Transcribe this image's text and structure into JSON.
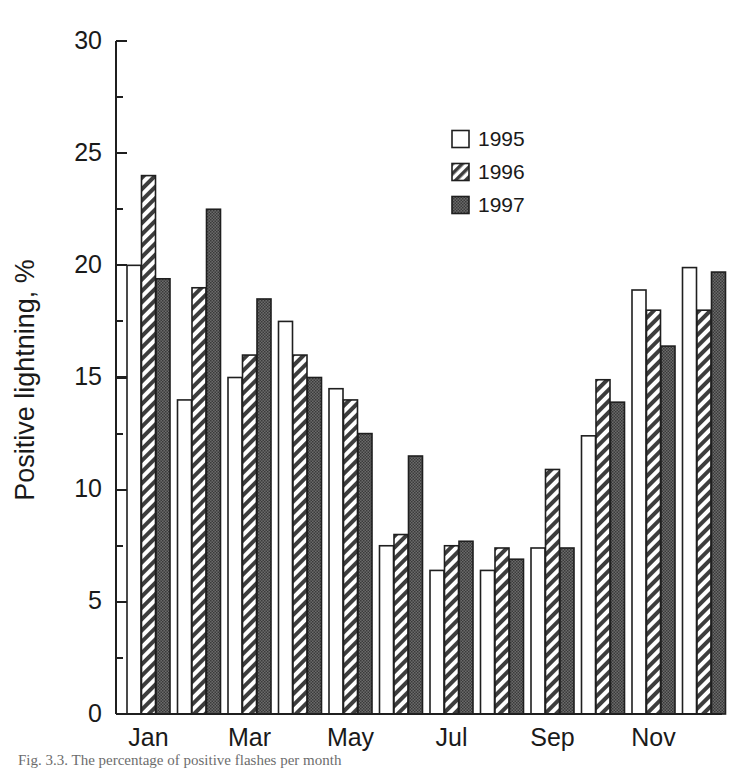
{
  "figure": {
    "caption": "Fig. 3.3.  The percentage of positive flashes per month"
  },
  "chart_data": {
    "type": "bar",
    "title": "",
    "xlabel": "",
    "ylabel": "Positive lightning, %",
    "ylim": [
      0,
      30
    ],
    "ytick_labels": [
      "0",
      "5",
      "10",
      "15",
      "20",
      "25",
      "30"
    ],
    "ytick_values": [
      0,
      5,
      10,
      15,
      20,
      25,
      30
    ],
    "yminor_values": [
      2.5,
      7.5,
      12.5,
      17.5,
      22.5,
      27.5
    ],
    "grid": false,
    "legend_position": "upper-center-right",
    "categories": [
      "Jan",
      "Feb",
      "Mar",
      "Apr",
      "May",
      "Jun",
      "Jul",
      "Aug",
      "Sep",
      "Oct",
      "Nov",
      "Dec"
    ],
    "xtick_labels": [
      "Jan",
      "Mar",
      "May",
      "Jul",
      "Sep",
      "Nov"
    ],
    "xtick_categories": [
      "Jan",
      "Mar",
      "May",
      "Jul",
      "Sep",
      "Nov"
    ],
    "series": [
      {
        "name": "1995",
        "fill": "open",
        "color": "#ffffff",
        "values": [
          20.0,
          14.0,
          15.0,
          17.5,
          14.5,
          7.5,
          6.4,
          6.4,
          7.4,
          12.4,
          18.9,
          19.9
        ]
      },
      {
        "name": "1996",
        "fill": "hatched",
        "color": "#d8d8d8",
        "values": [
          24.0,
          19.0,
          16.0,
          16.0,
          14.0,
          8.0,
          7.5,
          7.4,
          10.9,
          14.9,
          18.0,
          18.0
        ]
      },
      {
        "name": "1997",
        "fill": "solid",
        "color": "#5a5a5a",
        "values": [
          19.4,
          22.5,
          18.5,
          15.0,
          12.5,
          11.5,
          7.7,
          6.9,
          7.4,
          13.9,
          16.4,
          19.7
        ]
      }
    ]
  },
  "legend": {
    "entries": [
      {
        "label": "1995",
        "swatch": "open-square-swatch"
      },
      {
        "label": "1996",
        "swatch": "hatched-square-swatch"
      },
      {
        "label": "1997",
        "swatch": "solid-square-swatch"
      }
    ]
  }
}
